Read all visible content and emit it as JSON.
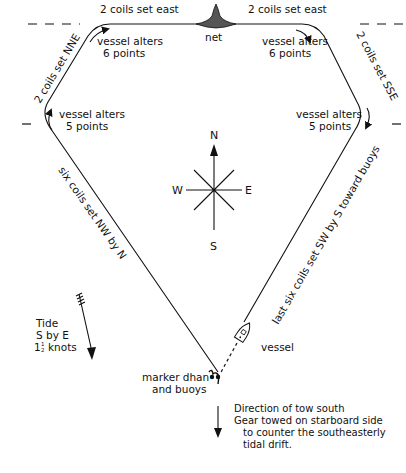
{
  "diagram": {
    "net_label": "net",
    "legs": [
      {
        "id": "east-left",
        "label": "2 coils set east"
      },
      {
        "id": "east-right",
        "label": "2 coils set east"
      },
      {
        "id": "nne",
        "label": "2 coils set NNE"
      },
      {
        "id": "sse",
        "label": "2 coils set SSE"
      },
      {
        "id": "nw",
        "label": "six coils set NW by N"
      },
      {
        "id": "sw",
        "label": "last six coils set SW by S toward buoys"
      }
    ],
    "turns": [
      {
        "id": "top-left",
        "line1": "vessel alters",
        "line2": "6 points"
      },
      {
        "id": "top-right",
        "line1": "vessel alters",
        "line2": "6 points"
      },
      {
        "id": "mid-left",
        "line1": "vessel alters",
        "line2": "5 points"
      },
      {
        "id": "mid-right",
        "line1": "vessel alters",
        "line2": "5 points"
      }
    ],
    "compass": {
      "n": "N",
      "s": "S",
      "e": "E",
      "w": "W"
    },
    "tide": {
      "line1": "Tide",
      "line2": "S by E",
      "line3_whole": "1",
      "line3_frac_num": "1",
      "line3_frac_den": "2",
      "line3_unit": "knots"
    },
    "vessel_label": "vessel",
    "marker": {
      "line1": "marker dhan",
      "line2": "and buoys"
    },
    "tow_note": {
      "line1": "Direction of tow south",
      "line2": "Gear towed on starboard side",
      "line3": "to counter the southeasterly",
      "line4": "tidal drift."
    }
  }
}
